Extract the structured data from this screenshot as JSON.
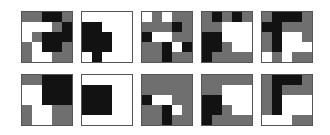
{
  "colors": {
    "w": "#ffffff",
    "g": "#6f6f6f",
    "b": "#121212"
  },
  "layout": {
    "x": [
      21,
      81,
      141,
      201,
      261
    ],
    "y": [
      11,
      74
    ]
  },
  "grids": [
    {
      "row": 0,
      "col": 0,
      "cells": [
        [
          "g",
          "g",
          "b",
          "b",
          "g"
        ],
        [
          "w",
          "w",
          "w",
          "g",
          "b"
        ],
        [
          "w",
          "g",
          "b",
          "b",
          "b"
        ],
        [
          "g",
          "w",
          "b",
          "b",
          "g"
        ],
        [
          "g",
          "w",
          "w",
          "g",
          "g"
        ]
      ]
    },
    {
      "row": 0,
      "col": 1,
      "cells": [
        [
          "w",
          "w",
          "w",
          "w",
          "w"
        ],
        [
          "b",
          "b",
          "w",
          "w",
          "w"
        ],
        [
          "b",
          "b",
          "b",
          "w",
          "w"
        ],
        [
          "b",
          "b",
          "b",
          "w",
          "w"
        ],
        [
          "w",
          "b",
          "w",
          "w",
          "w"
        ]
      ]
    },
    {
      "row": 0,
      "col": 2,
      "cells": [
        [
          "w",
          "g",
          "w",
          "g",
          "g"
        ],
        [
          "g",
          "g",
          "g",
          "b",
          "g"
        ],
        [
          "b",
          "w",
          "w",
          "g",
          "g"
        ],
        [
          "g",
          "g",
          "b",
          "w",
          "b"
        ],
        [
          "g",
          "g",
          "b",
          "g",
          "g"
        ]
      ]
    },
    {
      "row": 0,
      "col": 3,
      "cells": [
        [
          "g",
          "b",
          "g",
          "b",
          "g"
        ],
        [
          "g",
          "g",
          "w",
          "w",
          "w"
        ],
        [
          "b",
          "b",
          "w",
          "w",
          "w"
        ],
        [
          "b",
          "b",
          "g",
          "w",
          "w"
        ],
        [
          "b",
          "g",
          "g",
          "g",
          "g"
        ]
      ]
    },
    {
      "row": 0,
      "col": 4,
      "cells": [
        [
          "g",
          "b",
          "b",
          "b",
          "g"
        ],
        [
          "b",
          "b",
          "g",
          "g",
          "g"
        ],
        [
          "g",
          "b",
          "w",
          "w",
          "g"
        ],
        [
          "g",
          "b",
          "w",
          "w",
          "w"
        ],
        [
          "w",
          "g",
          "w",
          "g",
          "g"
        ]
      ]
    },
    {
      "row": 1,
      "col": 0,
      "cells": [
        [
          "g",
          "g",
          "b",
          "b",
          "b"
        ],
        [
          "w",
          "w",
          "b",
          "b",
          "b"
        ],
        [
          "w",
          "w",
          "b",
          "b",
          "b"
        ],
        [
          "g",
          "w",
          "w",
          "g",
          "g"
        ],
        [
          "g",
          "w",
          "w",
          "g",
          "g"
        ]
      ]
    },
    {
      "row": 1,
      "col": 1,
      "cells": [
        [
          "w",
          "w",
          "w",
          "w",
          "w"
        ],
        [
          "b",
          "b",
          "b",
          "w",
          "w"
        ],
        [
          "b",
          "b",
          "b",
          "w",
          "w"
        ],
        [
          "b",
          "b",
          "b",
          "w",
          "w"
        ],
        [
          "w",
          "w",
          "w",
          "w",
          "w"
        ]
      ]
    },
    {
      "row": 1,
      "col": 2,
      "cells": [
        [
          "g",
          "g",
          "g",
          "g",
          "g"
        ],
        [
          "g",
          "g",
          "g",
          "g",
          "g"
        ],
        [
          "b",
          "w",
          "w",
          "g",
          "g"
        ],
        [
          "g",
          "g",
          "b",
          "w",
          "g"
        ],
        [
          "g",
          "g",
          "b",
          "g",
          "g"
        ]
      ]
    },
    {
      "row": 1,
      "col": 3,
      "cells": [
        [
          "g",
          "g",
          "g",
          "g",
          "g"
        ],
        [
          "g",
          "g",
          "w",
          "w",
          "w"
        ],
        [
          "b",
          "b",
          "w",
          "w",
          "w"
        ],
        [
          "b",
          "b",
          "g",
          "w",
          "w"
        ],
        [
          "b",
          "g",
          "g",
          "g",
          "g"
        ]
      ]
    },
    {
      "row": 1,
      "col": 4,
      "cells": [
        [
          "g",
          "b",
          "b",
          "b",
          "g"
        ],
        [
          "g",
          "b",
          "g",
          "g",
          "g"
        ],
        [
          "g",
          "b",
          "w",
          "w",
          "w"
        ],
        [
          "g",
          "b",
          "w",
          "w",
          "w"
        ],
        [
          "w",
          "w",
          "w",
          "g",
          "g"
        ]
      ]
    }
  ]
}
